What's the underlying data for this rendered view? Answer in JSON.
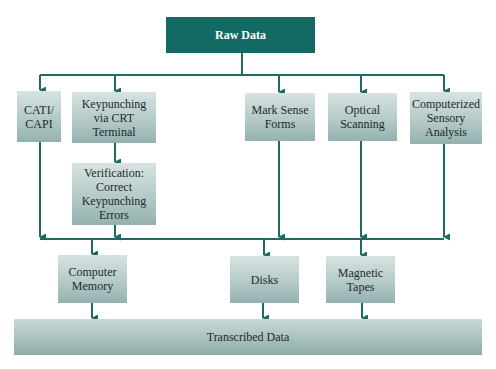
{
  "diagram": {
    "source": {
      "label": "Raw Data"
    },
    "input_methods": [
      {
        "label": "CATI/\nCAPI"
      },
      {
        "label": "Keypunching\nvia CRT\nTerminal"
      },
      {
        "label": "Mark Sense\nForms"
      },
      {
        "label": "Optical\nScanning"
      },
      {
        "label": "Computerized\nSensory\nAnalysis"
      }
    ],
    "verification": {
      "label": "Verification:\nCorrect\nKeypunching\nErrors"
    },
    "storage": [
      {
        "label": "Computer\nMemory"
      },
      {
        "label": "Disks"
      },
      {
        "label": "Magnetic\nTapes"
      }
    ],
    "output": {
      "label": "Transcribed Data"
    },
    "colors": {
      "header": "#136a62",
      "line": "#1f6b63",
      "box": "#b4cac8"
    }
  }
}
